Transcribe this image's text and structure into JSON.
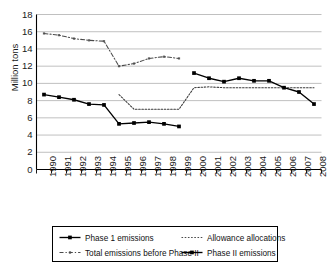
{
  "chart_data": {
    "type": "line",
    "title": "",
    "xlabel": "",
    "ylabel": "Million tons",
    "ylim": [
      0,
      18
    ],
    "ytick_step": 2,
    "yticks": [
      "18",
      "16",
      "14",
      "12",
      "10",
      "8",
      "6",
      "4",
      "2",
      "0"
    ],
    "grid": true,
    "legend_position": "bottom",
    "x": [
      "1990",
      "1991",
      "1992",
      "1993",
      "1994",
      "1995",
      "1996",
      "1997",
      "1998",
      "1999",
      "2000",
      "2001",
      "2002",
      "2003",
      "2004",
      "2005",
      "2006",
      "2007",
      "2008"
    ],
    "series": [
      {
        "name": "Phase 1 emissions",
        "style": "solid-marker",
        "color": "#000000",
        "points": [
          {
            "x": "1990",
            "y": 8.7
          },
          {
            "x": "1991",
            "y": 8.4
          },
          {
            "x": "1992",
            "y": 8.1
          },
          {
            "x": "1993",
            "y": 7.6
          },
          {
            "x": "1994",
            "y": 7.5
          },
          {
            "x": "1995",
            "y": 5.3
          },
          {
            "x": "1996",
            "y": 5.4
          },
          {
            "x": "1997",
            "y": 5.5
          },
          {
            "x": "1998",
            "y": 5.3
          },
          {
            "x": "1999",
            "y": 5.0
          }
        ]
      },
      {
        "name": "Allowance allocations",
        "style": "fine-dotted",
        "color": "#3a3a3a",
        "points": [
          {
            "x": "1995",
            "y": 8.7
          },
          {
            "x": "1996",
            "y": 7.0
          },
          {
            "x": "1997",
            "y": 7.0
          },
          {
            "x": "1998",
            "y": 7.0
          },
          {
            "x": "1999",
            "y": 7.0
          },
          {
            "x": "2000",
            "y": 9.5
          },
          {
            "x": "2001",
            "y": 9.6
          },
          {
            "x": "2002",
            "y": 9.5
          },
          {
            "x": "2003",
            "y": 9.5
          },
          {
            "x": "2004",
            "y": 9.5
          },
          {
            "x": "2005",
            "y": 9.5
          },
          {
            "x": "2006",
            "y": 9.5
          },
          {
            "x": "2007",
            "y": 9.5
          },
          {
            "x": "2008",
            "y": 9.5
          }
        ]
      },
      {
        "name": "Total emissions before Phase II",
        "style": "dash-dot",
        "color": "#4a4a4a",
        "points": [
          {
            "x": "1990",
            "y": 15.8
          },
          {
            "x": "1991",
            "y": 15.6
          },
          {
            "x": "1992",
            "y": 15.2
          },
          {
            "x": "1993",
            "y": 15.0
          },
          {
            "x": "1994",
            "y": 14.9
          },
          {
            "x": "1995",
            "y": 12.0
          },
          {
            "x": "1996",
            "y": 12.3
          },
          {
            "x": "1997",
            "y": 12.9
          },
          {
            "x": "1998",
            "y": 13.1
          },
          {
            "x": "1999",
            "y": 12.9
          }
        ]
      },
      {
        "name": "Phase II emissions",
        "style": "solid-marker",
        "color": "#000000",
        "points": [
          {
            "x": "2000",
            "y": 11.2
          },
          {
            "x": "2001",
            "y": 10.6
          },
          {
            "x": "2002",
            "y": 10.2
          },
          {
            "x": "2003",
            "y": 10.6
          },
          {
            "x": "2004",
            "y": 10.3
          },
          {
            "x": "2005",
            "y": 10.3
          },
          {
            "x": "2006",
            "y": 9.5
          },
          {
            "x": "2007",
            "y": 9.0
          },
          {
            "x": "2008",
            "y": 7.6
          }
        ]
      }
    ],
    "legend": [
      {
        "label": "Phase 1 emissions",
        "style": "solid-marker"
      },
      {
        "label": "Allowance allocations",
        "style": "fine-dotted"
      },
      {
        "label": "Total emissions before Phase II",
        "style": "dash-dot"
      },
      {
        "label": "Phase II emissions",
        "style": "solid-marker"
      }
    ]
  },
  "colors": {
    "axis": "#000000",
    "grid": "#b9b9b9",
    "series_primary": "#000000",
    "series_secondary": "#4a4a4a",
    "background": "#ffffff"
  }
}
